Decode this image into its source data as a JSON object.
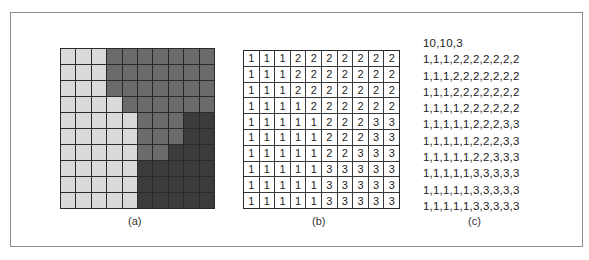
{
  "figure": {
    "panels": [
      {
        "id": "a",
        "label": "(a)",
        "type": "shaded-grid"
      },
      {
        "id": "b",
        "label": "(b)",
        "type": "numeric-grid"
      },
      {
        "id": "c",
        "label": "(c)",
        "type": "text-listing"
      }
    ],
    "grid": {
      "rows": 10,
      "cols": 10,
      "values": [
        [
          1,
          1,
          1,
          2,
          2,
          2,
          2,
          2,
          2,
          2
        ],
        [
          1,
          1,
          1,
          2,
          2,
          2,
          2,
          2,
          2,
          2
        ],
        [
          1,
          1,
          1,
          2,
          2,
          2,
          2,
          2,
          2,
          2
        ],
        [
          1,
          1,
          1,
          1,
          2,
          2,
          2,
          2,
          2,
          2
        ],
        [
          1,
          1,
          1,
          1,
          1,
          2,
          2,
          2,
          3,
          3
        ],
        [
          1,
          1,
          1,
          1,
          1,
          2,
          2,
          2,
          3,
          3
        ],
        [
          1,
          1,
          1,
          1,
          1,
          2,
          2,
          3,
          3,
          3
        ],
        [
          1,
          1,
          1,
          1,
          1,
          3,
          3,
          3,
          3,
          3
        ],
        [
          1,
          1,
          1,
          1,
          1,
          3,
          3,
          3,
          3,
          3
        ],
        [
          1,
          1,
          1,
          1,
          1,
          3,
          3,
          3,
          3,
          3
        ]
      ]
    },
    "shade_colors": {
      "1": "#d9d9d9",
      "2": "#6b6b6b",
      "3": "#3b3b3b"
    },
    "text_listing": {
      "header": "10,10,3",
      "lines": [
        "1,1,1,2,2,2,2,2,2,2",
        "1,1,1,2,2,2,2,2,2,2",
        "1,1,1,2,2,2,2,2,2,2",
        "1,1,1,1,2,2,2,2,2,2",
        "1,1,1,1,1,2,2,2,3,3",
        "1,1,1,1,1,2,2,2,3,3",
        "1,1,1,1,1,2,2,3,3,3",
        "1,1,1,1,1,3,3,3,3,3",
        "1,1,1,1,1,3,3,3,3,3",
        "1,1,1,1,1,3,3,3,3,3"
      ]
    }
  }
}
